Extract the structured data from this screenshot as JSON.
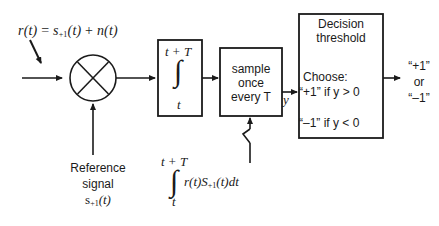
{
  "diagram": {
    "stroke_color": "#1a1a1a",
    "background": "#ffffff",
    "input_expression": {
      "lhs": "r(t)",
      "equals": " = ",
      "signal": "s",
      "signal_subscript": "+1",
      "signal_arg": "(t)",
      "plus": " + ",
      "noise": "n(t)"
    },
    "multiplier": {
      "name": "multiplier",
      "glyph": "x-in-circle"
    },
    "reference": {
      "line1": "Reference",
      "line2": "signal",
      "symbol": "s",
      "symbol_subscript": "+1",
      "symbol_arg": "(t)"
    },
    "integrator_box": {
      "upper_limit": "t + T",
      "integral_glyph": "∫",
      "lower_limit": "t"
    },
    "sample_box": {
      "line1": "sample",
      "line2": "once",
      "line3": "every T"
    },
    "sampler_signal_label": "y",
    "decision_box": {
      "title_line1": "Decision",
      "title_line2": "threshold",
      "choose_label": "Choose:",
      "rule_positive": "“+1” if y > 0",
      "rule_negative": "“–1” if y < 0"
    },
    "output": {
      "line1": "“+1”",
      "line2": "or",
      "line3": "“–1”"
    },
    "bottom_formula": {
      "upper_limit": "t + T",
      "integral_glyph": "∫",
      "lower_limit": "t",
      "integrand_r": "r(t)",
      "integrand_S": "S",
      "integrand_S_subscript": "+1",
      "integrand_S_arg": "(t)",
      "differential": "dt"
    }
  }
}
